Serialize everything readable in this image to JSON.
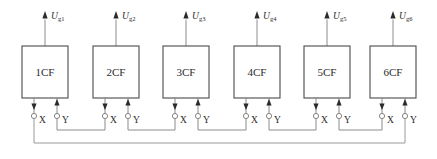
{
  "diagram": {
    "type": "block-diagram",
    "canvas": {
      "width": 437,
      "height": 159,
      "background": "#ffffff"
    },
    "colors": {
      "box_stroke": "#4a4a4a",
      "wire": "#8c8c8c",
      "bus_wire": "#9a9a9a",
      "terminal_ring": "#777777",
      "arrow_fill": "#2a2a2a",
      "text": "#2b2b2b",
      "background": "#ffffff"
    },
    "geometry": {
      "box_width": 46,
      "box_height": 52,
      "box_top": 46,
      "box_bottom": 98,
      "terminal_y": 116,
      "jumper_y": 130,
      "bus_y": 143,
      "label_y": 120,
      "output_arrow_top": 12,
      "output_label_y": 17,
      "box_lefts": [
        22,
        93,
        163,
        234,
        304,
        370
      ]
    },
    "units": [
      {
        "id": "unit-1",
        "label": "1CF",
        "output_symbol": "U",
        "output_subscript": "g1",
        "x_pin": "X",
        "y_pin": "Y",
        "box_left": 22,
        "x_pin_x": 34,
        "y_pin_x": 57
      },
      {
        "id": "unit-2",
        "label": "2CF",
        "output_symbol": "U",
        "output_subscript": "g2",
        "x_pin": "X",
        "y_pin": "Y",
        "box_left": 93,
        "x_pin_x": 105,
        "y_pin_x": 128
      },
      {
        "id": "unit-3",
        "label": "3CF",
        "output_symbol": "U",
        "output_subscript": "g3",
        "x_pin": "X",
        "y_pin": "Y",
        "box_left": 163,
        "x_pin_x": 175,
        "y_pin_x": 198
      },
      {
        "id": "unit-4",
        "label": "4CF",
        "output_symbol": "U",
        "output_subscript": "g4",
        "x_pin": "X",
        "y_pin": "Y",
        "box_left": 234,
        "x_pin_x": 246,
        "y_pin_x": 269
      },
      {
        "id": "unit-5",
        "label": "5CF",
        "output_symbol": "U",
        "output_subscript": "g5",
        "x_pin": "X",
        "y_pin": "Y",
        "box_left": 304,
        "x_pin_x": 316,
        "y_pin_x": 339
      },
      {
        "id": "unit-6",
        "label": "6CF",
        "output_symbol": "U",
        "output_subscript": "g6",
        "x_pin": "X",
        "y_pin": "Y",
        "box_left": 370,
        "x_pin_x": 382,
        "y_pin_x": 405
      }
    ],
    "connections": {
      "description": "Y terminal of each unit links to X terminal of the next unit; X of unit 1 and Y of unit 6 close the loop through the bottom return bus.",
      "jumpers": [
        {
          "from": "unit-1.Y",
          "to": "unit-2.X"
        },
        {
          "from": "unit-2.Y",
          "to": "unit-3.X"
        },
        {
          "from": "unit-3.Y",
          "to": "unit-4.X"
        },
        {
          "from": "unit-4.Y",
          "to": "unit-5.X"
        },
        {
          "from": "unit-5.Y",
          "to": "unit-6.X"
        }
      ],
      "return_bus": {
        "from": "unit-1.X",
        "to": "unit-6.Y",
        "y": 143
      }
    }
  }
}
